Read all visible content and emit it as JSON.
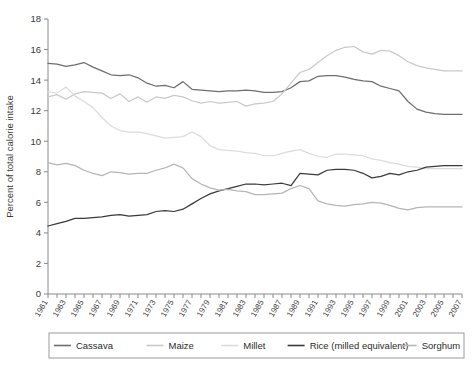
{
  "chart_data": {
    "type": "line",
    "title": "",
    "xlabel": "",
    "ylabel": "Percent of total calorie intake",
    "ylim": [
      0,
      18
    ],
    "ytick_step": 2,
    "yticks": [
      0,
      2,
      4,
      6,
      8,
      10,
      12,
      14,
      16,
      18
    ],
    "xlim": [
      1961,
      2007
    ],
    "xticks": [
      1961,
      1963,
      1965,
      1967,
      1969,
      1971,
      1973,
      1975,
      1977,
      1979,
      1981,
      1983,
      1985,
      1987,
      1989,
      1991,
      1993,
      1995,
      1997,
      1999,
      2001,
      2003,
      2005,
      2007
    ],
    "xtick_labels": [
      "1961",
      "1963",
      "1965",
      "1967",
      "1969",
      "1971",
      "1973",
      "1975",
      "1977",
      "1979",
      "1981",
      "1983",
      "1985",
      "1987",
      "1989",
      "1991",
      "1993",
      "1995",
      "1997",
      "1999",
      "2001",
      "2003",
      "2005",
      "2007"
    ],
    "x": [
      1961,
      1962,
      1963,
      1964,
      1965,
      1966,
      1967,
      1968,
      1969,
      1970,
      1971,
      1972,
      1973,
      1974,
      1975,
      1976,
      1977,
      1978,
      1979,
      1980,
      1981,
      1982,
      1983,
      1984,
      1985,
      1986,
      1987,
      1988,
      1989,
      1990,
      1991,
      1992,
      1993,
      1994,
      1995,
      1996,
      1997,
      1998,
      1999,
      2000,
      2001,
      2002,
      2003,
      2004,
      2005,
      2006,
      2007
    ],
    "grid": false,
    "legend_position": "bottom",
    "series": [
      {
        "name": "Cassava",
        "color": "#6e6e6e",
        "values": [
          15.1,
          15.05,
          14.9,
          15.0,
          15.15,
          14.85,
          14.6,
          14.35,
          14.3,
          14.35,
          14.15,
          13.8,
          13.6,
          13.65,
          13.5,
          13.9,
          13.4,
          13.35,
          13.3,
          13.25,
          13.3,
          13.3,
          13.35,
          13.3,
          13.2,
          13.2,
          13.25,
          13.5,
          13.9,
          13.95,
          14.25,
          14.3,
          14.3,
          14.2,
          14.05,
          13.95,
          13.9,
          13.6,
          13.45,
          13.3,
          12.6,
          12.1,
          11.9,
          11.8,
          11.75,
          11.75,
          11.75
        ]
      },
      {
        "name": "Maize",
        "color": "#c9c9c9",
        "values": [
          12.9,
          13.05,
          12.75,
          13.1,
          13.25,
          13.2,
          13.15,
          12.8,
          13.1,
          12.6,
          12.9,
          12.55,
          12.9,
          12.8,
          13.0,
          12.9,
          12.65,
          12.5,
          12.6,
          12.5,
          12.55,
          12.6,
          12.3,
          12.45,
          12.5,
          12.6,
          13.1,
          13.8,
          14.5,
          14.7,
          15.15,
          15.6,
          15.95,
          16.15,
          16.2,
          15.85,
          15.7,
          15.95,
          15.9,
          15.6,
          15.2,
          14.95,
          14.8,
          14.7,
          14.6,
          14.6,
          14.6
        ]
      },
      {
        "name": "Millet",
        "color": "#dcdcdc",
        "values": [
          13.25,
          13.15,
          13.55,
          12.95,
          12.6,
          12.2,
          11.55,
          11.0,
          10.7,
          10.6,
          10.6,
          10.5,
          10.35,
          10.2,
          10.25,
          10.3,
          10.6,
          10.3,
          9.7,
          9.45,
          9.4,
          9.35,
          9.25,
          9.2,
          9.05,
          9.05,
          9.2,
          9.35,
          9.45,
          9.2,
          9.0,
          8.95,
          9.15,
          9.15,
          9.1,
          9.05,
          8.85,
          8.75,
          8.6,
          8.5,
          8.35,
          8.3,
          8.2,
          8.2,
          8.2,
          8.2,
          8.2
        ]
      },
      {
        "name": "Rice (milled equivalent)",
        "color": "#3a3a3a",
        "values": [
          4.45,
          4.6,
          4.75,
          4.95,
          4.95,
          5.0,
          5.05,
          5.15,
          5.2,
          5.1,
          5.15,
          5.2,
          5.4,
          5.45,
          5.4,
          5.55,
          5.9,
          6.25,
          6.55,
          6.75,
          6.9,
          7.05,
          7.2,
          7.2,
          7.15,
          7.2,
          7.25,
          7.1,
          7.9,
          7.85,
          7.8,
          8.1,
          8.15,
          8.15,
          8.1,
          7.9,
          7.6,
          7.7,
          7.9,
          7.8,
          8.0,
          8.1,
          8.3,
          8.35,
          8.4,
          8.4,
          8.4
        ]
      },
      {
        "name": "Sorghum",
        "color": "#b5b5b5",
        "values": [
          8.6,
          8.45,
          8.55,
          8.4,
          8.1,
          7.9,
          7.75,
          8.0,
          7.95,
          7.85,
          7.9,
          7.9,
          8.1,
          8.25,
          8.5,
          8.25,
          7.55,
          7.2,
          6.95,
          6.8,
          6.85,
          6.75,
          6.7,
          6.5,
          6.5,
          6.55,
          6.6,
          6.9,
          7.1,
          6.9,
          6.1,
          5.9,
          5.8,
          5.75,
          5.85,
          5.9,
          6.0,
          5.95,
          5.8,
          5.6,
          5.5,
          5.65,
          5.7,
          5.7,
          5.7,
          5.7,
          5.7
        ]
      }
    ]
  },
  "legend": {
    "items": [
      {
        "label": "Cassava"
      },
      {
        "label": "Maize"
      },
      {
        "label": "Millet"
      },
      {
        "label": "Rice (milled equivalent)"
      },
      {
        "label": "Sorghum"
      }
    ]
  }
}
